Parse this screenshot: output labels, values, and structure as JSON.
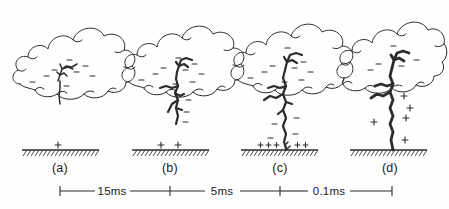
{
  "figure": {
    "background_color": "#fefefe",
    "ink_color": "#2b2b2b"
  },
  "panels": [
    {
      "id": "a",
      "label": "(a)",
      "description": "Charged cloud with in-cloud discharge beginning; single positive charge induced on ground",
      "cloud_charge_symbol": "−",
      "cloud_charge_count": 8,
      "ground_charge_symbol": "+",
      "ground_charge_count": 1,
      "leader_stage": "in-cloud"
    },
    {
      "id": "b",
      "label": "(b)",
      "description": "Stepped leader emerges below cloud base with branches",
      "cloud_charge_symbol": "−",
      "cloud_charge_count": 9,
      "ground_charge_symbol": "+",
      "ground_charge_count": 2,
      "leader_stage": "descending"
    },
    {
      "id": "c",
      "label": "(c)",
      "description": "Stepped leader approaches ground, upward streamer rises to meet it",
      "cloud_charge_symbol": "−",
      "cloud_charge_count": 9,
      "ground_charge_symbol": "+",
      "ground_charge_count": 5,
      "leader_stage": "attachment"
    },
    {
      "id": "d",
      "label": "(d)",
      "description": "Return stroke channel connects cloud to ground; positive charge moves up the channel",
      "cloud_charge_symbol": "−",
      "cloud_charge_count": 5,
      "ground_charge_symbol": "+",
      "ground_charge_count": 5,
      "leader_stage": "return-stroke"
    }
  ],
  "timeline": {
    "intervals": [
      {
        "label": "15ms",
        "from": "a",
        "to": "b"
      },
      {
        "label": "5ms",
        "from": "b",
        "to": "c"
      },
      {
        "label": "0.1ms",
        "from": "c",
        "to": "d"
      }
    ],
    "tick_count": 4
  }
}
